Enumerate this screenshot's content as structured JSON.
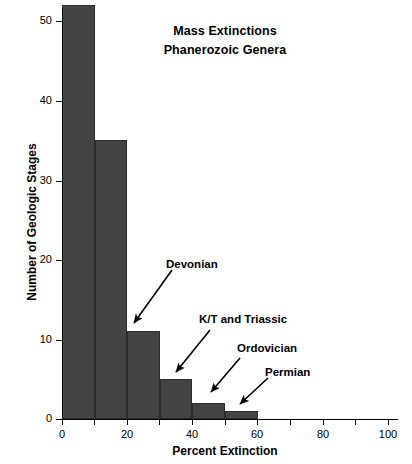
{
  "chart_data": {
    "type": "bar",
    "title": "Mass Extinctions\nPhanerozoic Genera",
    "title_lines": [
      "Mass Extinctions",
      "Phanerozoic Genera"
    ],
    "xlabel": "Percent Extinction",
    "ylabel": "Number of Geologic Stages",
    "xlim": [
      0,
      103
    ],
    "ylim": [
      0,
      52
    ],
    "grid": false,
    "legend": false,
    "bin_width": 10,
    "categories": [
      "0-10",
      "10-20",
      "20-30",
      "30-40",
      "40-50",
      "50-60"
    ],
    "bin_starts": [
      0,
      10,
      20,
      30,
      40,
      50
    ],
    "values": [
      52,
      35,
      11,
      5,
      2,
      1
    ],
    "bar_color": "#444444",
    "bar_edge_color": "#2b2b2b",
    "x_ticks": [
      0,
      10,
      20,
      30,
      40,
      50,
      60,
      70,
      80,
      90,
      100
    ],
    "x_tick_labels": [
      {
        "value": 0,
        "label": "0"
      },
      {
        "value": 20,
        "label": "20"
      },
      {
        "value": 40,
        "label": "40"
      },
      {
        "value": 60,
        "label": "60"
      },
      {
        "value": 80,
        "label": "80"
      },
      {
        "value": 100,
        "label": "100"
      }
    ],
    "y_ticks": [
      0,
      10,
      20,
      30,
      40,
      50
    ],
    "y_tick_labels": [
      "0",
      "10",
      "20",
      "30",
      "40",
      "50"
    ],
    "annotations": [
      {
        "text": "Devonian",
        "points_to_bin": "20-30",
        "points_to_x": 22,
        "points_to_y": 12
      },
      {
        "text": "K/T and Triassic",
        "points_to_bin": "30-40",
        "points_to_x": 34,
        "points_to_y": 6
      },
      {
        "text": "Ordovician",
        "points_to_bin": "40-50",
        "points_to_x": 44,
        "points_to_y": 3
      },
      {
        "text": "Permian",
        "points_to_bin": "50-60",
        "points_to_x": 54,
        "points_to_y": 2
      }
    ]
  },
  "annotation_labels": {
    "devonian": "Devonian",
    "kt_triassic": "K/T and Triassic",
    "ordovician": "Ordovician",
    "permian": "Permian"
  },
  "axis": {
    "x_title": "Percent Extinction",
    "y_title": "Number of Geologic Stages"
  },
  "title": {
    "line1": "Mass Extinctions",
    "line2": "Phanerozoic Genera"
  },
  "xtick_labels": {
    "t0": "0",
    "t20": "20",
    "t40": "40",
    "t60": "60",
    "t80": "80",
    "t100": "100"
  },
  "ytick_labels": {
    "t0": "0",
    "t10": "10",
    "t20": "20",
    "t30": "30",
    "t40": "40",
    "t50": "50"
  }
}
